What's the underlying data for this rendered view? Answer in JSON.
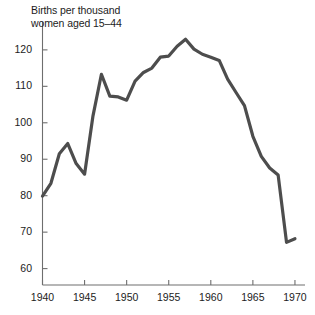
{
  "chart_data": {
    "type": "line",
    "title": "Births per thousand\nwomen aged 15–44",
    "title_line1": "Births per thousand",
    "title_line2": "women aged 15–44",
    "xlabel": "",
    "ylabel": "",
    "xlim": [
      1940,
      1970.6
    ],
    "ylim": [
      55.5,
      126
    ],
    "xticks": [
      1940,
      1945,
      1950,
      1955,
      1960,
      1965,
      1970
    ],
    "xtick_labels": [
      "1940",
      "1945",
      "1950",
      "1955",
      "1960",
      "1965",
      "1970"
    ],
    "yticks": [
      60,
      70,
      80,
      90,
      100,
      110,
      120
    ],
    "ytick_labels": [
      "60",
      "70",
      "80",
      "90",
      "100",
      "110",
      "120"
    ],
    "grid": false,
    "legend": null,
    "line_color": "#4d4d4d",
    "axis_color": "#6e6e6e",
    "line_width": 3.2,
    "x": [
      1940,
      1941,
      1942,
      1943,
      1944,
      1945,
      1946,
      1947,
      1948,
      1949,
      1950,
      1951,
      1952,
      1953,
      1954,
      1955,
      1956,
      1957,
      1958,
      1959,
      1960,
      1961,
      1962,
      1963,
      1964,
      1965,
      1966,
      1967,
      1968,
      1969,
      1970
    ],
    "values": [
      79.9,
      83.4,
      91.5,
      94.3,
      88.8,
      85.9,
      101.9,
      113.3,
      107.3,
      107.1,
      106.2,
      111.4,
      113.8,
      115.0,
      118.0,
      118.3,
      121.0,
      122.9,
      120.2,
      118.8,
      118.0,
      117.1,
      112.0,
      108.3,
      104.7,
      96.3,
      90.8,
      87.6,
      85.7,
      67.2,
      68.2
    ]
  }
}
